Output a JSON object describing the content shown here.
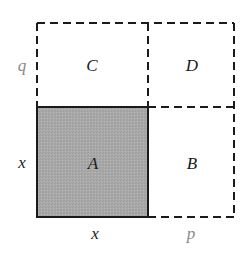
{
  "diagram": {
    "regions": {
      "A": "A",
      "B": "B",
      "C": "C",
      "D": "D"
    },
    "side_labels": {
      "left_top": "q",
      "left_bottom": "x",
      "bottom_left": "x",
      "bottom_right": "p"
    },
    "colors": {
      "shaded_fill": "#a8a8a8",
      "solid_stroke": "#1a1a1a",
      "dashed_stroke": "#1a1a1a",
      "dim_label": "#888888",
      "label": "#1a1a1a"
    }
  }
}
